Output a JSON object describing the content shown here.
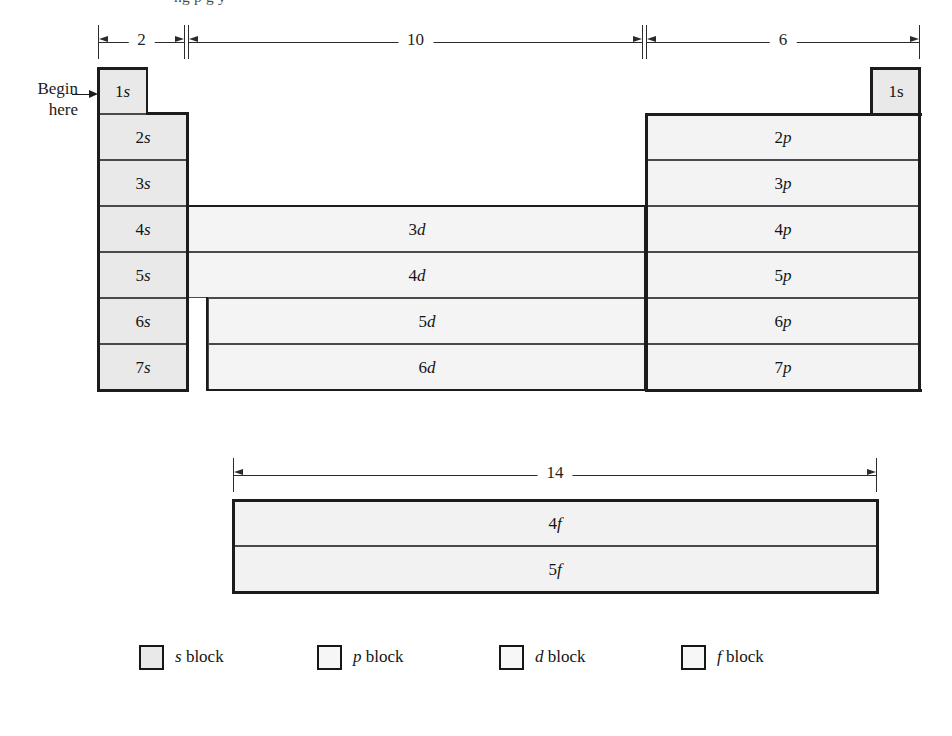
{
  "figure": {
    "cutoff_text_above": "ng p       g y",
    "begin_marker": {
      "line1": "Begin",
      "line2": "here",
      "arrow": "right-arrow-icon"
    }
  },
  "dimensions": [
    {
      "name": "s-block-width",
      "label": "2",
      "x": 98,
      "width": 87,
      "y": 31
    },
    {
      "name": "d-block-width",
      "label": "10",
      "x": 188,
      "width": 455,
      "y": 31
    },
    {
      "name": "p-block-width",
      "label": "6",
      "x": 646,
      "width": 274,
      "y": 31
    },
    {
      "name": "f-block-width",
      "label": "14",
      "x": 233,
      "width": 644,
      "y": 464
    }
  ],
  "blocks": {
    "s": {
      "legend": "s block",
      "fill": "#e9e9e9",
      "cells": [
        {
          "label": "1s",
          "num": "1",
          "orb": "s",
          "x": 98,
          "y": 68,
          "w": 49,
          "h": 46,
          "italic": true,
          "heavy": true
        },
        {
          "label": "2s",
          "num": "2",
          "orb": "s",
          "x": 98,
          "y": 114,
          "w": 90,
          "h": 46,
          "italic": true,
          "heavy": true
        },
        {
          "label": "3s",
          "num": "3",
          "orb": "s",
          "x": 98,
          "y": 160,
          "w": 90,
          "h": 46,
          "italic": true,
          "heavy": true
        },
        {
          "label": "4s",
          "num": "4",
          "orb": "s",
          "x": 98,
          "y": 206,
          "w": 90,
          "h": 46,
          "italic": true,
          "heavy": true
        },
        {
          "label": "5s",
          "num": "5",
          "orb": "s",
          "x": 98,
          "y": 252,
          "w": 90,
          "h": 46,
          "italic": true,
          "heavy": true
        },
        {
          "label": "6s",
          "num": "6",
          "orb": "s",
          "x": 98,
          "y": 298,
          "w": 90,
          "h": 46,
          "italic": true,
          "heavy": true
        },
        {
          "label": "7s",
          "num": "7",
          "orb": "s",
          "x": 98,
          "y": 344,
          "w": 90,
          "h": 46,
          "italic": true,
          "heavy": true
        },
        {
          "label": "1s",
          "num": "1",
          "orb": "s",
          "x": 872,
          "y": 68,
          "w": 48,
          "h": 46,
          "italic": false,
          "heavy": true
        }
      ]
    },
    "p": {
      "legend": "p block",
      "fill": "#f3f3f3",
      "cells": [
        {
          "label": "2p",
          "num": "2",
          "orb": "p",
          "x": 646,
          "y": 114,
          "w": 274,
          "h": 46,
          "italic": true
        },
        {
          "label": "3p",
          "num": "3",
          "orb": "p",
          "x": 646,
          "y": 160,
          "w": 274,
          "h": 46,
          "italic": true
        },
        {
          "label": "4p",
          "num": "4",
          "orb": "p",
          "x": 646,
          "y": 206,
          "w": 274,
          "h": 46,
          "italic": true
        },
        {
          "label": "5p",
          "num": "5",
          "orb": "p",
          "x": 646,
          "y": 252,
          "w": 274,
          "h": 46,
          "italic": true
        },
        {
          "label": "6p",
          "num": "6",
          "orb": "p",
          "x": 646,
          "y": 298,
          "w": 274,
          "h": 46,
          "italic": true
        },
        {
          "label": "7p",
          "num": "7",
          "orb": "p",
          "x": 646,
          "y": 344,
          "w": 274,
          "h": 46,
          "italic": true
        }
      ]
    },
    "d": {
      "legend": "d block",
      "fill": "#f4f4f4",
      "cells": [
        {
          "label": "3d",
          "num": "3",
          "orb": "d",
          "x": 188,
          "y": 206,
          "w": 458,
          "h": 46,
          "italic": true
        },
        {
          "label": "4d",
          "num": "4",
          "orb": "d",
          "x": 188,
          "y": 252,
          "w": 458,
          "h": 46,
          "italic": true
        },
        {
          "label": "5d",
          "num": "5",
          "orb": "d",
          "x": 208,
          "y": 298,
          "w": 438,
          "h": 46,
          "italic": true
        },
        {
          "label": "6d",
          "num": "6",
          "orb": "d",
          "x": 208,
          "y": 344,
          "w": 438,
          "h": 46,
          "italic": true
        }
      ]
    },
    "f": {
      "legend": "f block",
      "fill": "#f2f2f2",
      "cells": [
        {
          "label": "4f",
          "num": "4",
          "orb": "f",
          "x": 233,
          "y": 500,
          "w": 644,
          "h": 46,
          "italic": true
        },
        {
          "label": "5f",
          "num": "5",
          "orb": "f",
          "x": 233,
          "y": 546,
          "w": 644,
          "h": 46,
          "italic": true
        }
      ]
    }
  },
  "legend": {
    "items": [
      {
        "name": "s-block",
        "prefix": "s",
        "suffix": " block",
        "fill": "#e9e9e9",
        "x": 139
      },
      {
        "name": "p-block",
        "prefix": "p",
        "suffix": " block",
        "fill": "#f6f6f6",
        "x": 317
      },
      {
        "name": "d-block",
        "prefix": "d",
        "suffix": " block",
        "fill": "#f7f7f7",
        "x": 499
      },
      {
        "name": "f-block",
        "prefix": "f",
        "suffix": " block",
        "fill": "#f7f7f7",
        "x": 681
      }
    ]
  }
}
